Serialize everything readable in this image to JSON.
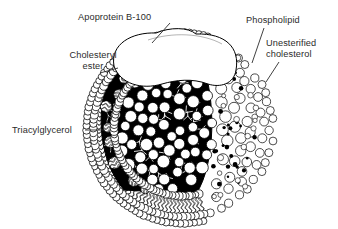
{
  "figure": {
    "type": "scientific-illustration",
    "background_color": "#ffffff",
    "ink_color": "#000000",
    "text_color": "#2b2b2b",
    "width": 338,
    "height": 229
  },
  "labels": [
    {
      "id": "apoprotein",
      "text": "Apoprotein B-100",
      "x": 78,
      "y": 12,
      "align": "left",
      "leader": [
        [
          170,
          23
        ],
        [
          152,
          43
        ]
      ]
    },
    {
      "id": "phospholipid",
      "text": "Phospholipid",
      "x": 246,
      "y": 15,
      "align": "left",
      "leader": [
        [
          264,
          28
        ],
        [
          252,
          63
        ]
      ]
    },
    {
      "id": "unesterified-cholesterol",
      "text": "Unesterified\ncholesterol",
      "x": 266,
      "y": 38,
      "align": "left",
      "leader": [
        [
          279,
          62
        ],
        [
          266,
          82
        ]
      ]
    },
    {
      "id": "cholesteryl-ester",
      "text": "Cholesteryl\nester",
      "x": 50,
      "y": 50,
      "align": "center",
      "leader": [
        [
          100,
          73
        ],
        [
          118,
          68
        ]
      ]
    },
    {
      "id": "triacylglycerol",
      "text": "Triacylglycerol",
      "x": 12,
      "y": 125,
      "align": "left",
      "leader": [
        [
          85,
          130
        ],
        [
          105,
          130
        ]
      ]
    }
  ],
  "particle": {
    "center_x": 182,
    "center_y": 128,
    "radius": 93,
    "core_label": "hydrophobic core",
    "shell_label": "phospholipid monolayer",
    "apoprotein_label": "apoprotein B-100 blob",
    "components": [
      {
        "name": "Apoprotein B-100",
        "region": "surface protein"
      },
      {
        "name": "Phospholipid",
        "region": "outer monolayer"
      },
      {
        "name": "Unesterified cholesterol",
        "region": "outer monolayer"
      },
      {
        "name": "Cholesteryl ester",
        "region": "core"
      },
      {
        "name": "Triacylglycerol",
        "region": "core"
      }
    ]
  }
}
